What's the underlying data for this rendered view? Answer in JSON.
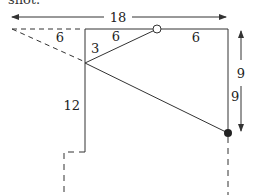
{
  "caption_fragment": "shot.",
  "labels": {
    "total_width": "18",
    "dashed_segment": "6",
    "top_left_segment": "6",
    "top_right_segment": "6",
    "left_upper": "3",
    "left_lower": "12",
    "right_inner": "9",
    "right_outer": "9"
  },
  "markers": {
    "open_circle": "open point on top edge",
    "filled_dot": "filled point on right edge"
  },
  "colors": {
    "line": "#333333",
    "background": "#ffffff"
  }
}
